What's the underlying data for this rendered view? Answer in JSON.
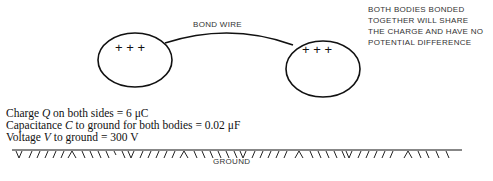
{
  "diagram": {
    "wire_label": "BOND WIRE",
    "left_body_charges": "+ + +",
    "right_body_charges": "+ + +",
    "note_lines": [
      "BOTH BODIES BONDED",
      "TOGETHER WILL SHARE",
      "THE CHARGE AND HAVE NO",
      "POTENTIAL DIFFERENCE"
    ],
    "equations": [
      {
        "prefix": "Charge ",
        "var": "Q",
        "suffix": " on both sides = 6 μC"
      },
      {
        "prefix": "Capacitance ",
        "var": "C",
        "suffix": " to ground for both bodies = 0.02 μF"
      },
      {
        "prefix": "Voltage ",
        "var": "V",
        "suffix": " to ground = 300 V"
      }
    ],
    "ground_label": "GROUND"
  }
}
